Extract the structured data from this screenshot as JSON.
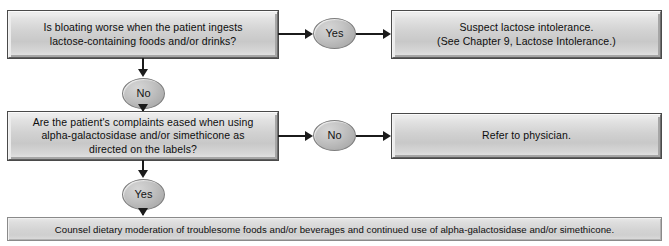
{
  "diagram": {
    "type": "flowchart",
    "colors": {
      "box_fill": "#d2d2d2",
      "banner_fill": "#d3d3d3",
      "ellipse_fill": "#b8b8b8",
      "connector": "#1b1b1b",
      "text": "#0d0d0d",
      "background": "#ffffff"
    },
    "nodes": {
      "decision1": {
        "kind": "decision-box",
        "lines": [
          "Is bloating worse when the patient ingests",
          "lactose-containing foods and/or drinks?"
        ]
      },
      "decision1_yes_label": {
        "kind": "ellipse",
        "text": "Yes"
      },
      "decision1_no_label": {
        "kind": "ellipse",
        "text": "No"
      },
      "outcome1": {
        "kind": "process-box",
        "lines": [
          "Suspect lactose intolerance.",
          "(See Chapter 9, Lactose Intolerance.)"
        ]
      },
      "decision2": {
        "kind": "decision-box",
        "lines": [
          "Are the patient's complaints eased when using",
          "alpha-galactosidase and/or simethicone as",
          "directed on the labels?"
        ]
      },
      "decision2_no_label": {
        "kind": "ellipse",
        "text": "No"
      },
      "decision2_yes_label": {
        "kind": "ellipse",
        "text": "Yes"
      },
      "outcome2": {
        "kind": "process-box",
        "lines": [
          "Refer to physician."
        ]
      },
      "outcome3": {
        "kind": "banner-box",
        "lines": [
          "Counsel dietary moderation of troublesome foods and/or beverages and continued use of alpha-galactosidase and/or simethicone."
        ]
      }
    }
  }
}
